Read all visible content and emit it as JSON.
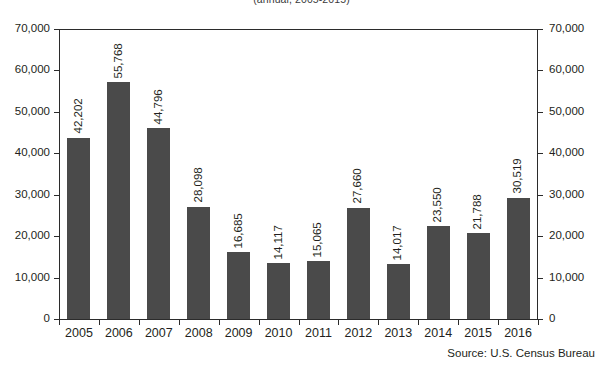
{
  "chart_data": {
    "type": "bar",
    "title": "",
    "subtitle": "(annual, 2005-2015)",
    "xlabel": "",
    "ylabel": "",
    "ylim": [
      0,
      70000
    ],
    "ytick_step": 10000,
    "ytick_labels": [
      "0",
      "10,000",
      "20,000",
      "30,000",
      "40,000",
      "50,000",
      "60,000",
      "70,000"
    ],
    "ytick_values": [
      0,
      10000,
      20000,
      30000,
      40000,
      50000,
      60000,
      70000
    ],
    "grid": false,
    "legend": "none",
    "dual_axis": true,
    "bar_color": "#4a4a4a",
    "categories": [
      "2005",
      "2006",
      "2007",
      "2008",
      "2009",
      "2010",
      "2011",
      "2012",
      "2013",
      "2014",
      "2015",
      "2016"
    ],
    "values": [
      42202,
      55768,
      44796,
      28098,
      16685,
      14117,
      15065,
      27660,
      14017,
      23550,
      21788,
      30519
    ],
    "value_labels": [
      "42,202",
      "55,768",
      "44,796",
      "28,098",
      "16,685",
      "14,117",
      "15,065",
      "27,660",
      "14,017",
      "23,550",
      "21,788",
      "30,519"
    ],
    "plotted_heights": [
      43700,
      57200,
      46000,
      27100,
      16100,
      13500,
      14000,
      26800,
      13200,
      22400,
      20700,
      29300
    ],
    "annotations": [
      "Source: U.S. Census Bureau"
    ]
  },
  "source_note": "Source: U.S. Census Bureau"
}
